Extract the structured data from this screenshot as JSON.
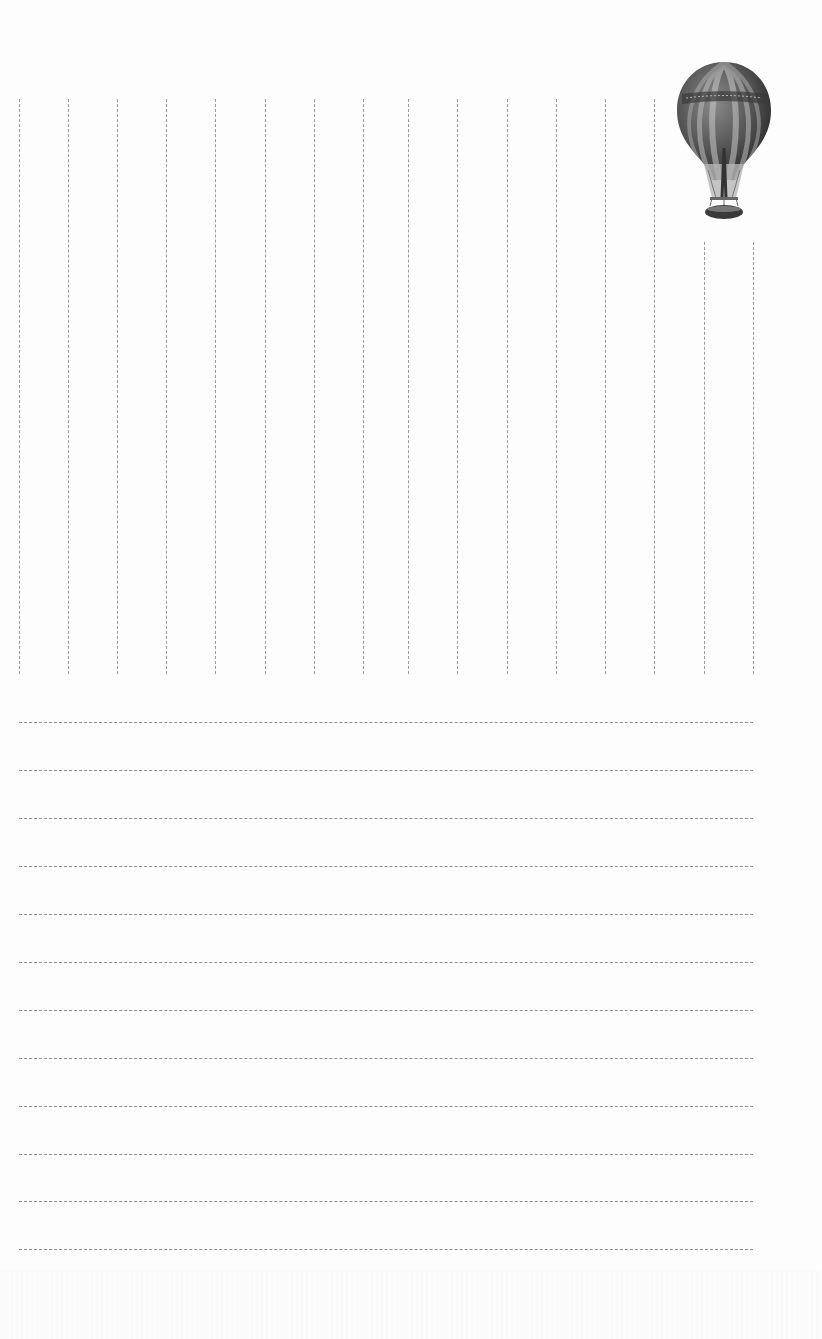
{
  "page": {
    "type": "stationery-letter-paper",
    "background_color": "#fdfdfd",
    "line_color": "#9a9a9a"
  },
  "illustration": {
    "icon": "hot-air-balloon-icon",
    "description": "Vintage engraved striped hot air balloon with basket"
  },
  "vertical_grid": {
    "x_positions": [
      19,
      68,
      117,
      166,
      215,
      265,
      314,
      363,
      408,
      457,
      507,
      556,
      605,
      654,
      704,
      753
    ],
    "top": 99,
    "top_short": 242,
    "bottom": 674,
    "short_columns": [
      704,
      753
    ]
  },
  "writing_lines": {
    "y_positions": [
      722,
      770,
      818,
      866,
      914,
      962,
      1010,
      1058,
      1106,
      1154,
      1201,
      1249
    ],
    "x_start": 19,
    "x_end": 753
  }
}
